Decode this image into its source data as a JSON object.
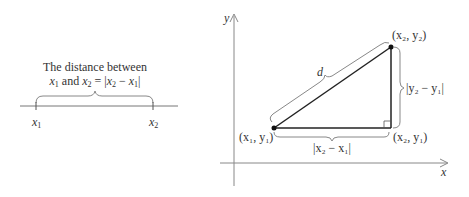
{
  "left_diagram": {
    "caption_line1": "The distance between",
    "caption_line2_parts": {
      "x1": "x",
      "sub1": "1",
      "and": " and ",
      "x2": "x",
      "sub2": "2",
      "equals": " = |",
      "x2b": "x",
      "sub2b": "2",
      "minus": " − ",
      "x1b": "x",
      "sub1b": "1",
      "close": "|"
    },
    "tick_labels": [
      {
        "var": "x",
        "sub": "1"
      },
      {
        "var": "x",
        "sub": "2"
      }
    ]
  },
  "right_diagram": {
    "axis_x_label": "x",
    "axis_y_label": "y",
    "point_top": "(x₂, y₂)",
    "point_left": "(x₁, y₁)",
    "point_corner": "(x₂, y₁)",
    "hyp_label": "d",
    "vertical_label": "|y₂ − y₁|",
    "horizontal_label": "|x₂ − x₁|"
  },
  "colors": {
    "axis": "#777777",
    "line": "#222222",
    "brace": "#888888",
    "text": "#333333"
  }
}
